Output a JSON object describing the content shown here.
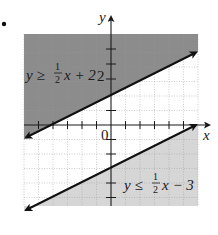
{
  "figure": {
    "label_fragment": ".",
    "axes": {
      "x_label": "x",
      "y_label": "y",
      "origin_label": "0",
      "y_tick_label": "2",
      "x_range": [
        -6,
        6
      ],
      "y_range": [
        -5.6,
        6.3
      ],
      "unit_px": 14.5
    },
    "inequalities": [
      {
        "id": "upper",
        "prefix": "y ≥ ",
        "fraction_num": "1",
        "fraction_den": "2",
        "suffix": "x + 2",
        "slope": 0.5,
        "intercept": 2,
        "shade": "above",
        "shade_color": "#8c8c8c"
      },
      {
        "id": "lower",
        "prefix": "y ≤ ",
        "fraction_num": "1",
        "fraction_den": "2",
        "suffix": "x − 3",
        "slope": 0.5,
        "intercept": -3,
        "shade": "below",
        "shade_color": "#d6d6d6"
      }
    ],
    "colors": {
      "grid": "#9a9a9a",
      "axis": "#1a1a1a",
      "line": "#111111"
    }
  }
}
